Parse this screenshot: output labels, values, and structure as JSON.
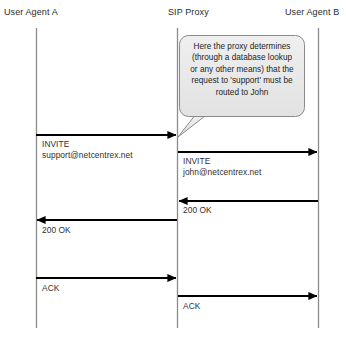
{
  "diagram": {
    "type": "sequence-diagram",
    "colors": {
      "lifeline": "#8c8c8c",
      "arrow": "#000000",
      "callout_fill": "#e8e8e8",
      "callout_stroke": "#8a8a8a",
      "text": "#2b2b2b",
      "background": "#ffffff"
    },
    "actors": [
      {
        "id": "ua_a",
        "label": "User Agent A",
        "x": 36
      },
      {
        "id": "proxy",
        "label": "SIP Proxy",
        "x": 177
      },
      {
        "id": "ua_b",
        "label": "User Agent B",
        "x": 318
      }
    ],
    "callout": {
      "text": "Here the proxy determines (through a database lookup or any other means) that the request to 'support' must be routed to John",
      "lines": [
        "Here the proxy determines",
        "(through a database lookup",
        "or any other means) that the",
        "request to 'support' must be",
        "routed to John"
      ]
    },
    "messages": [
      {
        "id": "invite-1",
        "label": "INVITE",
        "detail": "support@netcentrex.net",
        "from": "ua_a",
        "to": "proxy",
        "direction": "right",
        "y": 135
      },
      {
        "id": "invite-2",
        "label": "INVITE",
        "detail": "john@netcentrex.net",
        "from": "proxy",
        "to": "ua_b",
        "direction": "right",
        "y": 152
      },
      {
        "id": "ok-1",
        "label": "200 OK",
        "detail": "",
        "from": "ua_b",
        "to": "proxy",
        "direction": "left",
        "y": 201
      },
      {
        "id": "ok-2",
        "label": "200 OK",
        "detail": "",
        "from": "proxy",
        "to": "ua_a",
        "direction": "left",
        "y": 220
      },
      {
        "id": "ack-1",
        "label": "ACK",
        "detail": "",
        "from": "ua_a",
        "to": "proxy",
        "direction": "right",
        "y": 278
      },
      {
        "id": "ack-2",
        "label": "ACK",
        "detail": "",
        "from": "proxy",
        "to": "ua_b",
        "direction": "right",
        "y": 296
      }
    ]
  }
}
